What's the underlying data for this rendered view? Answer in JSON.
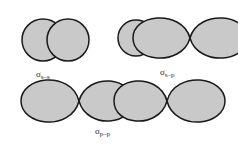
{
  "figure": {
    "background_color": "#ffffff",
    "orbital_fill_color": "#c9c9c9",
    "orbital_stroke_color": "#1a1a1a",
    "label_color": "#2b2b2b",
    "diagrams": [
      {
        "id": "sigma-s-s",
        "sigma_symbol": "σ",
        "subscript": "s–s",
        "description": "two overlapping spherical s orbitals",
        "shapes": [
          "circle",
          "circle"
        ]
      },
      {
        "id": "sigma-s-p",
        "sigma_symbol": "σ",
        "subscript": "s–p",
        "description": "spherical s orbital overlapping a two-lobed p orbital",
        "shapes": [
          "circle",
          "lobe",
          "lobe"
        ]
      },
      {
        "id": "sigma-p-p",
        "sigma_symbol": "σ",
        "subscript": "p–p",
        "description": "two two-lobed p orbitals overlapping end to end",
        "shapes": [
          "lobe",
          "lobe",
          "lobe",
          "lobe"
        ]
      }
    ]
  }
}
